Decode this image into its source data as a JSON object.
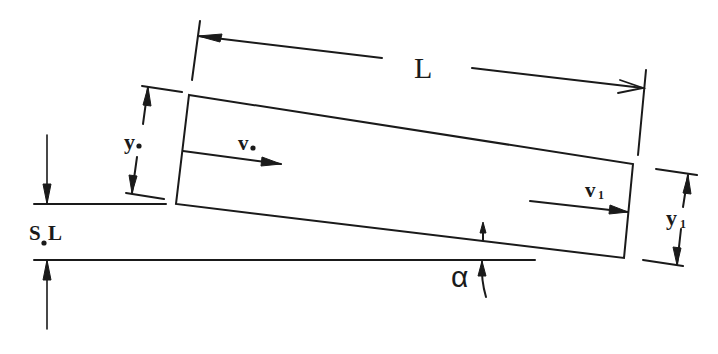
{
  "diagram": {
    "labels": {
      "length": "L",
      "depth_upstream": "y",
      "depth_upstream_sub": "o",
      "velocity_upstream": "v",
      "velocity_upstream_sub": "o",
      "velocity_downstream": "v",
      "velocity_downstream_sub": "1",
      "depth_downstream": "y",
      "depth_downstream_sub": "1",
      "drop": "S",
      "drop_sub": "o",
      "drop_suffix": " L",
      "angle": "α"
    },
    "colors": {
      "ink": "#1a1a1a",
      "background": "#ffffff"
    }
  }
}
